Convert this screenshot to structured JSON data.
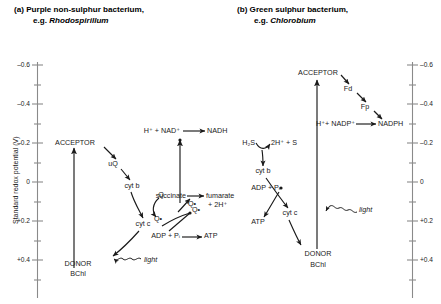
{
  "panels": {
    "a": {
      "label": "(a)",
      "title": "Purple non-sulphur bacterium,",
      "subtitle_prefix": "e.g. ",
      "organism": "Rhodospirillum"
    },
    "b": {
      "label": "(b)",
      "title": "Green sulphur bacterium,",
      "subtitle_prefix": "e.g. ",
      "organism": "Chlorobium"
    }
  },
  "axis": {
    "title": "Standard redox potential (V)",
    "ticks_left": [
      "–0.6",
      "–0.4",
      "–0.2",
      "0",
      "+0.2",
      "+0.4"
    ],
    "ticks_right": [
      "–0.6",
      "–0.4",
      "–0.2",
      "0",
      "+0.2",
      "+0.4"
    ]
  },
  "panel_a_nodes": {
    "acceptor": "ACCEPTOR",
    "uq": "uQ",
    "cytb": "cyt b",
    "q": "Q",
    "qdot": "Q•",
    "cytc": "cyt c",
    "donor_line1": "DONOR",
    "donor_line2": "BChl",
    "light": "light",
    "nad_reaction": "H⁺ + NAD⁺",
    "nadh": "NADH",
    "succinate": "succinate",
    "fumarate": "fumarate",
    "fumarate2": "+ 2H⁺",
    "qdot2": "Q•",
    "adp_pi": "ADP + Pᵢ",
    "atp": "ATP",
    "qdot3": "Q•"
  },
  "panel_b_nodes": {
    "acceptor": "ACCEPTOR",
    "fd": "Fd",
    "fp": "Fp",
    "nadp_reaction": "H⁺+ NADP⁺",
    "nadph": "NADPH",
    "h2s": "H₂S",
    "products": "2H⁺ + S",
    "cytb": "cyt b",
    "adp_pi": "ADP + Pᵢ",
    "atp": "ATP",
    "cytc": "cyt c",
    "donor_line1": "DONOR",
    "donor_line2": "BChl",
    "light": "light"
  },
  "colors": {
    "ink": "#1a1a1a",
    "axis": "#8a8a8a",
    "background": "#ffffff"
  }
}
